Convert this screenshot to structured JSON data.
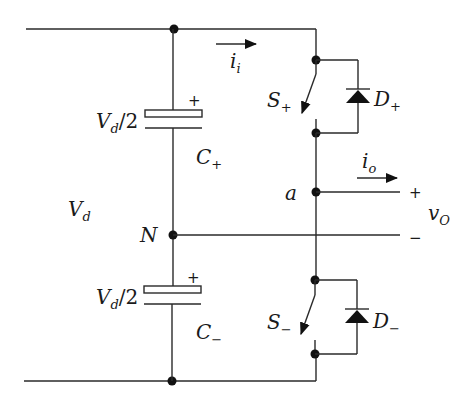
{
  "diagram": {
    "type": "half-bridge voltage source inverter",
    "colors": {
      "wire": "#2a2a2a",
      "background": "#ffffff"
    },
    "labels": {
      "dc_voltage": {
        "main": "V",
        "sub": "d"
      },
      "cap_top_voltage": {
        "main": "V",
        "sub": "d",
        "suffix": "/2"
      },
      "cap_bottom_voltage": {
        "main": "V",
        "sub": "d",
        "suffix": "/2"
      },
      "cap_top_name": {
        "main": "C",
        "sub": "+"
      },
      "cap_bottom_name": {
        "main": "C",
        "sub": "−"
      },
      "cap_top_polarity": "+",
      "cap_bottom_polarity": "+",
      "neutral_node": "N",
      "output_node": "a",
      "input_current": {
        "main": "i",
        "sub": "i"
      },
      "output_current": {
        "main": "i",
        "sub": "o"
      },
      "switch_top": {
        "main": "S",
        "sub": "+"
      },
      "switch_bottom": {
        "main": "S",
        "sub": "−"
      },
      "diode_top": {
        "main": "D",
        "sub": "+"
      },
      "diode_bottom": {
        "main": "D",
        "sub": "−"
      },
      "output_voltage": {
        "main": "v",
        "sub": "O"
      },
      "output_plus": "+",
      "output_minus": "−"
    },
    "components": [
      "dc-rail-top",
      "dc-rail-bottom",
      "capacitor-c-plus",
      "capacitor-c-minus",
      "switch-s-plus",
      "switch-s-minus",
      "diode-d-plus",
      "diode-d-minus",
      "node-n",
      "node-a"
    ]
  }
}
